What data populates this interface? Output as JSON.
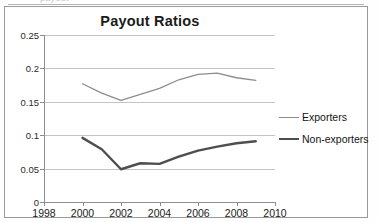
{
  "artifact": {
    "top_fragment": "payout"
  },
  "chart": {
    "title": "Payout Ratios",
    "legend": {
      "items": [
        {
          "label": "Exporters",
          "color": "#8d8d8d"
        },
        {
          "label": "Non-exporters",
          "color": "#4e4e4e"
        }
      ]
    }
  },
  "chart_data": {
    "type": "line",
    "title": "Payout Ratios",
    "xlabel": "",
    "ylabel": "",
    "xlim": [
      1998,
      2010
    ],
    "ylim": [
      0,
      0.25
    ],
    "xticks": [
      1998,
      2000,
      2002,
      2004,
      2006,
      2008,
      2010
    ],
    "xtick_labels": [
      "1998",
      "2000",
      "2002",
      "2004",
      "2006",
      "2008",
      "2010"
    ],
    "yticks": [
      0,
      0.05,
      0.1,
      0.15,
      0.2,
      0.25
    ],
    "ytick_labels": [
      "0",
      "0.05",
      "0.1",
      "0.15",
      "0.2",
      "0.25"
    ],
    "grid": "horizontal",
    "legend_position": "right",
    "x": [
      2000,
      2001,
      2002,
      2003,
      2004,
      2005,
      2006,
      2007,
      2008,
      2009
    ],
    "series": [
      {
        "name": "Exporters",
        "color": "#8d8d8d",
        "line_width": 1.3,
        "values": [
          0.177,
          0.163,
          0.152,
          0.161,
          0.17,
          0.183,
          0.191,
          0.193,
          0.186,
          0.182
        ]
      },
      {
        "name": "Non-exporters",
        "color": "#4e4e4e",
        "line_width": 2.4,
        "values": [
          0.096,
          0.079,
          0.049,
          0.058,
          0.057,
          0.068,
          0.077,
          0.083,
          0.088,
          0.091
        ]
      }
    ]
  }
}
